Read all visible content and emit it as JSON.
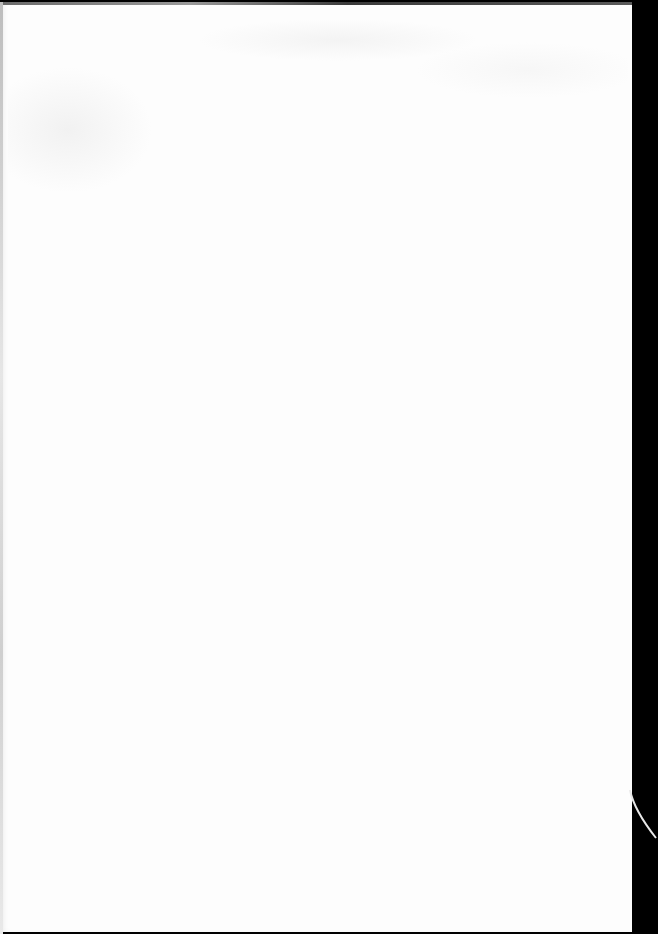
{
  "document": {
    "type": "scanned-blank-page",
    "content_text": "",
    "colors": {
      "paper": "#fdfdfd",
      "scanner_background": "#000000",
      "edge_shadow": "#5a5a5a"
    }
  }
}
